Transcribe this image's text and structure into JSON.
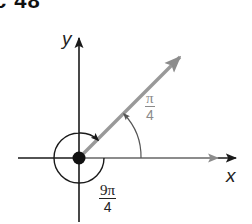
{
  "header": {
    "title": "c 48"
  },
  "diagram": {
    "axes": {
      "x_label": "x",
      "y_label": "y"
    },
    "angles": [
      {
        "name": "reference-angle",
        "numerator": "π",
        "denominator": "4",
        "color": "#8a8a8a"
      },
      {
        "name": "coterminal-angle",
        "numerator": "9π",
        "denominator": "4",
        "color": "#222222"
      }
    ],
    "colors": {
      "axis": "#1a1a1a",
      "ray": "#8c8c8c",
      "background": "#ffffff"
    }
  }
}
